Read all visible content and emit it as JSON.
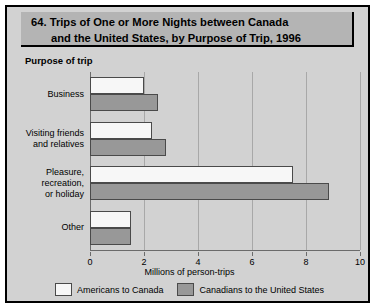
{
  "figure": {
    "title_line1": "64. Trips of One or More Nights between Canada",
    "title_line2": "and the United States, by Purpose of Trip, 1996",
    "axis_group_title": "Purpose of trip"
  },
  "chart_data": {
    "type": "bar",
    "orientation": "horizontal",
    "title": "64. Trips of One or More Nights between Canada and the United States, by Purpose of Trip, 1996",
    "categories": [
      "Business",
      "Visiting friends and relatives",
      "Pleasure, recreation, or holiday",
      "Other"
    ],
    "category_lines": [
      [
        "Business"
      ],
      [
        "Visiting friends",
        "and relatives"
      ],
      [
        "Pleasure,",
        "recreation,",
        "or holiday"
      ],
      [
        "Other"
      ]
    ],
    "series": [
      {
        "name": "Americans to Canada",
        "color": "#f7f7f7",
        "values": [
          2.0,
          2.3,
          7.5,
          1.5
        ]
      },
      {
        "name": "Canadians to the United States",
        "color": "#989898",
        "values": [
          2.5,
          2.8,
          8.85,
          1.5
        ]
      }
    ],
    "xlabel": "Millions of person-trips",
    "ylabel": "Purpose of trip",
    "xlim": [
      0,
      10
    ],
    "xticks": [
      0,
      2,
      4,
      6,
      8,
      10
    ],
    "xtick_labels": [
      "0",
      "2",
      "4",
      "6",
      "8",
      "10"
    ],
    "grid": true,
    "legend_position": "bottom"
  },
  "colors": {
    "background": "#d2d2d2",
    "title_band": "#b4b4b4",
    "border": "#000000",
    "bar_white": "#f7f7f7",
    "bar_gray": "#989898",
    "gridline": "#a8a8a8"
  }
}
